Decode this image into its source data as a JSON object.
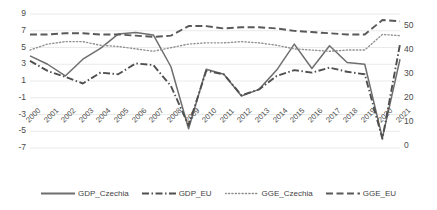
{
  "chart_data": {
    "type": "line",
    "title": "",
    "xlabel": "",
    "ylabel": "",
    "categories": [
      "2000",
      "2001",
      "2002",
      "2003",
      "2004",
      "2005",
      "2006",
      "2007",
      "2008",
      "2009",
      "2010",
      "2011",
      "2012",
      "2013",
      "2014",
      "2015",
      "2016",
      "2017",
      "2018",
      "2019",
      "2020",
      "2021"
    ],
    "axes": {
      "left": {
        "ticks": [
          9,
          7,
          5,
          3,
          1,
          -1,
          -3,
          -5,
          -7
        ],
        "lim": [
          -7,
          9
        ],
        "series": [
          "GDP_Czechia",
          "GDP_EU"
        ]
      },
      "right": {
        "ticks": [
          50,
          40,
          30,
          20,
          10,
          0
        ],
        "lim": [
          0,
          50
        ],
        "series": [
          "GGE_Czechia",
          "GGE_EU"
        ]
      }
    },
    "grid": true,
    "legend_position": "bottom",
    "series": [
      {
        "name": "GDP_Czechia",
        "axis": "left",
        "style": "solid",
        "color": "#6e6e6e",
        "values": [
          4.0,
          3.0,
          1.6,
          3.6,
          4.9,
          6.6,
          6.8,
          6.5,
          2.7,
          -4.7,
          2.4,
          1.8,
          -0.8,
          0.0,
          2.3,
          5.4,
          2.5,
          5.2,
          3.2,
          3.0,
          -5.8,
          3.6
        ]
      },
      {
        "name": "GDP_EU",
        "axis": "left",
        "style": "dashdot",
        "color": "#4f4f4f",
        "values": [
          3.4,
          2.2,
          1.5,
          0.7,
          2.0,
          1.8,
          3.1,
          2.9,
          0.4,
          -4.3,
          2.2,
          1.8,
          -0.7,
          0.0,
          1.6,
          2.3,
          2.0,
          2.6,
          2.1,
          1.8,
          -5.9,
          5.4
        ]
      },
      {
        "name": "GGE_Czechia",
        "axis": "right",
        "style": "dotted",
        "color": "#909090",
        "values": [
          40.0,
          42.5,
          43.5,
          43.5,
          42.0,
          41.5,
          40.5,
          39.5,
          41.0,
          42.5,
          43.0,
          43.0,
          43.5,
          43.0,
          42.0,
          40.5,
          40.0,
          39.5,
          40.0,
          40.0,
          46.5,
          46.0
        ]
      },
      {
        "name": "GGE_EU",
        "axis": "right",
        "style": "dashed",
        "color": "#595959",
        "values": [
          46.5,
          46.5,
          47.0,
          47.0,
          46.5,
          46.5,
          46.0,
          45.5,
          46.0,
          50.0,
          50.0,
          49.0,
          49.5,
          49.5,
          49.0,
          48.0,
          47.5,
          47.0,
          46.5,
          46.5,
          52.5,
          52.0
        ]
      }
    ]
  },
  "legend": {
    "items": [
      {
        "label": "GDP_Czechia",
        "key": "line-key-solid"
      },
      {
        "label": "GDP_EU",
        "key": "line-key-dashdot"
      },
      {
        "label": "GGE_Czechia",
        "key": "line-key-dotted"
      },
      {
        "label": "GGE_EU",
        "key": "line-key-dashed"
      }
    ]
  }
}
